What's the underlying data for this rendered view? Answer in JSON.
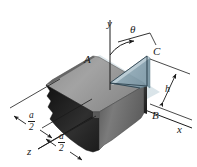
{
  "figure": {
    "background_color": "#ffffff",
    "width": 197,
    "height": 167
  },
  "axes": {
    "y_label": "y",
    "x_label": "x",
    "z_label": "z",
    "axis_color": "#1a1a1a"
  },
  "angle": {
    "label": "θ",
    "description": "angle measured from the y axis toward point C"
  },
  "points": {
    "A": "A",
    "B": "B",
    "C": "C"
  },
  "dimensions": {
    "height": {
      "label": "h",
      "description": "height of block measured along the right side"
    },
    "half_width_front": {
      "numerator": "a",
      "denominator": "2"
    },
    "half_width_back": {
      "numerator": "a",
      "denominator": "2"
    }
  },
  "colors": {
    "block_top_face": "#9a9a9a",
    "block_front_face": "#6f6f6f",
    "block_side_face": "#2a2a2a",
    "block_dark_edge": "#141414",
    "cut_plane_fill": "#b9cdd6",
    "cut_plane_edge": "#6d8a97",
    "line_color": "#1a1a1a",
    "text_color": "#1a1a1a"
  }
}
